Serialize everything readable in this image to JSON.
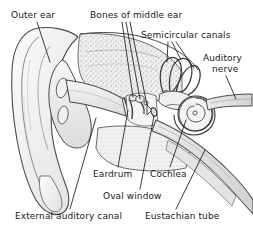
{
  "figure": {
    "background_color": "#ffffff",
    "line_color": "#3a3a3a",
    "text_color": "#1a1a1a",
    "shading_color": "#d9d9d9",
    "width": 253,
    "height": 231
  },
  "labels": {
    "outer_ear": "Outer ear",
    "bones_of_middle_ear": "Bones of middle ear",
    "semicircular_canals": "Semicircular canals",
    "auditory_nerve_line1": "Auditory",
    "auditory_nerve_line2": "nerve",
    "eardrum": "Eardrum",
    "cochlea": "Cochlea",
    "oval_window": "Oval window",
    "external_auditory_canal": "External auditory canal",
    "eustachian_tube": "Eustachian tube"
  },
  "parts": {
    "pinna": "outer-ear-pinna",
    "ear_canal": "external-auditory-canal",
    "eardrum": "tympanic-membrane",
    "ossicles": "bones-of-middle-ear",
    "semicircular_canals": "semicircular-canals",
    "cochlea": "cochlea-spiral",
    "auditory_nerve": "auditory-nerve",
    "eustachian_tube": "eustachian-tube",
    "oval_window": "oval-window",
    "temporal_bone": "temporal-bone-cross-section"
  }
}
